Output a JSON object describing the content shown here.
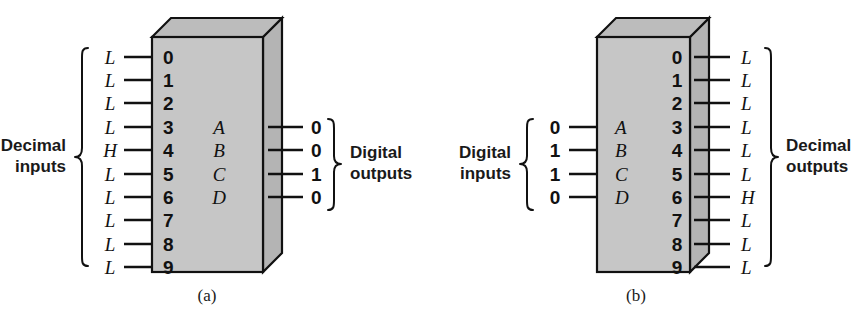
{
  "figure": {
    "background_color": "#ffffff",
    "box_fill_color": "#c6c6c6",
    "line_color": "#111111"
  },
  "panels": [
    {
      "id": "a",
      "caption": "(a)",
      "caption_letter": "a",
      "device": "decimal-to-binary encoder",
      "left_group_label_line1": "Decimal",
      "left_group_label_line2": "inputs",
      "right_group_label_line1": "Digital",
      "right_group_label_line2": "outputs",
      "left_pins": [
        {
          "pin": "0",
          "value": "L"
        },
        {
          "pin": "1",
          "value": "L"
        },
        {
          "pin": "2",
          "value": "L"
        },
        {
          "pin": "3",
          "value": "L"
        },
        {
          "pin": "4",
          "value": "H"
        },
        {
          "pin": "5",
          "value": "L"
        },
        {
          "pin": "6",
          "value": "L"
        },
        {
          "pin": "7",
          "value": "L"
        },
        {
          "pin": "8",
          "value": "L"
        },
        {
          "pin": "9",
          "value": "L"
        }
      ],
      "right_pins": [
        {
          "pin": "A",
          "value": "0"
        },
        {
          "pin": "B",
          "value": "0"
        },
        {
          "pin": "C",
          "value": "1"
        },
        {
          "pin": "D",
          "value": "0"
        }
      ]
    },
    {
      "id": "b",
      "caption": "(b)",
      "caption_letter": "b",
      "device": "binary-to-decimal decoder",
      "left_group_label_line1": "Digital",
      "left_group_label_line2": "inputs",
      "right_group_label_line1": "Decimal",
      "right_group_label_line2": "outputs",
      "left_pins": [
        {
          "pin": "A",
          "value": "0"
        },
        {
          "pin": "B",
          "value": "1"
        },
        {
          "pin": "C",
          "value": "1"
        },
        {
          "pin": "D",
          "value": "0"
        }
      ],
      "right_pins": [
        {
          "pin": "0",
          "value": "L"
        },
        {
          "pin": "1",
          "value": "L"
        },
        {
          "pin": "2",
          "value": "L"
        },
        {
          "pin": "3",
          "value": "L"
        },
        {
          "pin": "4",
          "value": "L"
        },
        {
          "pin": "5",
          "value": "L"
        },
        {
          "pin": "6",
          "value": "H"
        },
        {
          "pin": "7",
          "value": "L"
        },
        {
          "pin": "8",
          "value": "L"
        },
        {
          "pin": "9",
          "value": "L"
        }
      ]
    }
  ]
}
